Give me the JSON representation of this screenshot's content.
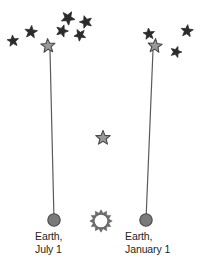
{
  "diagram": {
    "colors": {
      "background": "#ffffff",
      "star_fill_dark": "#2b2b2b",
      "star_fill_light": "#9a9a9a",
      "star_outline": "#4a4a4a",
      "sight_line": "#5a5a5a",
      "earth_fill": "#7a7a7a",
      "earth_outline": "#4a4a4a",
      "sun_outline": "#6a6a6a",
      "text": "#231f20"
    },
    "labels": {
      "earth_july": {
        "line1": "Earth,",
        "line2": "July 1"
      },
      "earth_january": {
        "line1": "Earth,",
        "line2": "January 1"
      }
    },
    "background_stars": [
      {
        "id": "bg-star-l1",
        "x": 13,
        "y": 41,
        "r": 6.0
      },
      {
        "id": "bg-star-l2",
        "x": 31,
        "y": 32,
        "r": 6.6
      },
      {
        "id": "bg-star-l3",
        "x": 62,
        "y": 31,
        "r": 6.4
      },
      {
        "id": "bg-star-l4",
        "x": 68,
        "y": 18,
        "r": 7.2
      },
      {
        "id": "bg-star-l5",
        "x": 80,
        "y": 35,
        "r": 6.2
      },
      {
        "id": "bg-star-l6",
        "x": 86,
        "y": 22,
        "r": 6.6
      },
      {
        "id": "bg-star-r1",
        "x": 149,
        "y": 34,
        "r": 6.0
      },
      {
        "id": "bg-star-r2",
        "x": 187,
        "y": 31,
        "r": 6.4
      },
      {
        "id": "bg-star-r3",
        "x": 176,
        "y": 52,
        "r": 5.8
      }
    ],
    "apparent_positions": [
      {
        "id": "apparent-star-july",
        "label": "apparent position seen July 1",
        "x": 48,
        "y": 46,
        "r": 7.4
      },
      {
        "id": "apparent-star-january",
        "label": "apparent position seen January 1",
        "x": 155,
        "y": 46,
        "r": 7.4
      }
    ],
    "target_star": {
      "id": "nearby-star",
      "x": 103,
      "y": 138,
      "r": 7.6
    },
    "earths": [
      {
        "id": "earth-july",
        "x": 54,
        "y": 220,
        "r": 6.2
      },
      {
        "id": "earth-january",
        "x": 146,
        "y": 220,
        "r": 6.2
      }
    ],
    "sun": {
      "id": "sun",
      "x": 101,
      "y": 221,
      "r": 7.0,
      "ray_count": 12
    },
    "sight_lines": [
      {
        "id": "sight-line-july",
        "x1": 54,
        "y1": 220,
        "x2": 50,
        "y2": 50
      },
      {
        "id": "sight-line-january",
        "x1": 146,
        "y1": 220,
        "x2": 153,
        "y2": 50
      }
    ]
  }
}
